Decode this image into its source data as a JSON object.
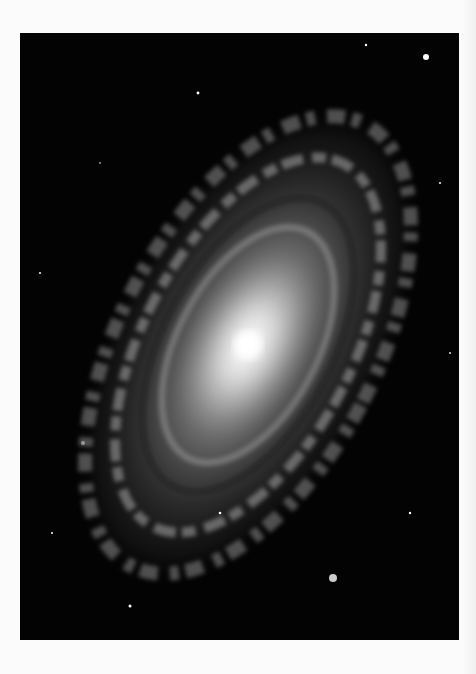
{
  "image": {
    "subject": "spiral galaxy",
    "alt": "Grayscale photograph of a spiral galaxy with bright core and dusty arms against a black starfield",
    "colors": {
      "background": "#fbfbfb",
      "sky": "#030303",
      "core": "#ffffff",
      "arms": "#9a9a9a"
    }
  }
}
